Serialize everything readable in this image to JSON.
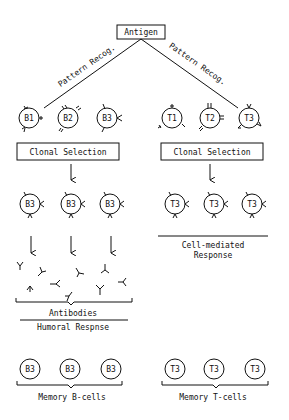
{
  "diagram": {
    "root": {
      "label": "Antigen"
    },
    "edges": [
      {
        "label": "Pattern Recog.",
        "from": "Antigen",
        "to": "B1"
      },
      {
        "label": "Pattern Recog.",
        "from": "Antigen",
        "to": "T3"
      }
    ],
    "b_cells": [
      "B1",
      "B2",
      "B3"
    ],
    "t_cells": [
      "T1",
      "T2",
      "T3"
    ],
    "b_clonal_selection": "Clonal Selection",
    "t_clonal_selection": "Clonal Selection",
    "b_clones": [
      "B3",
      "B3",
      "B3"
    ],
    "t_clones": [
      "T3",
      "T3",
      "T3"
    ],
    "antibodies_label": "Antibodies",
    "humoral_label": "Humoral Respnse",
    "cell_mediated_label_1": "Cell-mediated",
    "cell_mediated_label_2": "Response",
    "memory_b_cells": [
      "B3",
      "B3",
      "B3"
    ],
    "memory_t_cells": [
      "T3",
      "T3",
      "T3"
    ],
    "memory_b_label": "Memory B-cells",
    "memory_t_label": "Memory T-cells"
  }
}
